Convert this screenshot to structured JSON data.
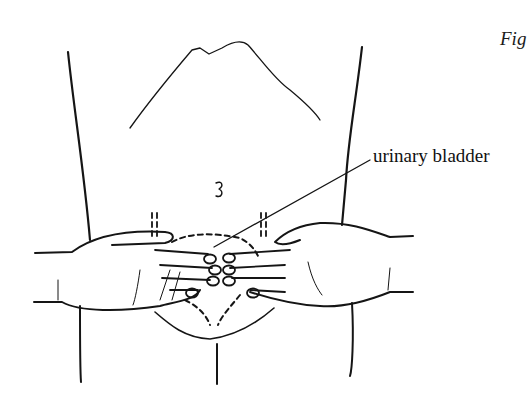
{
  "figure": {
    "label": "Fig",
    "callout_label": "urinary bladder"
  },
  "colors": {
    "ink": "#151515",
    "background": "#ffffff"
  }
}
